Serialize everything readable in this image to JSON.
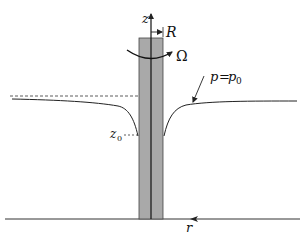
{
  "diagram": {
    "type": "physics-schematic",
    "labels": {
      "z_axis": "z",
      "radius": "R",
      "angular_velocity": "Ω",
      "pressure_condition_p": "p",
      "pressure_condition_eq": "=",
      "pressure_condition_p0": "p",
      "pressure_condition_p0_sub": "0",
      "z0_main": "z",
      "z0_sub": "0",
      "r_axis": "r"
    },
    "colors": {
      "rod_fill": "#a9a9a9",
      "line": "#222222",
      "background": "#ffffff"
    }
  }
}
